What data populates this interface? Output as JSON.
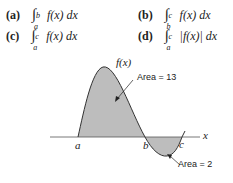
{
  "problems": [
    {
      "label": "(a)",
      "lower": "a",
      "upper": "b",
      "integrand": "f(x) dx"
    },
    {
      "label": "(b)",
      "lower": "b",
      "upper": "c",
      "integrand": "f(x) dx"
    },
    {
      "label": "(c)",
      "lower": "a",
      "upper": "c",
      "integrand": "f(x) dx"
    },
    {
      "label": "(d)",
      "lower": "a",
      "upper": "c",
      "integrand": "|f(x)| dx"
    }
  ],
  "graph": {
    "curve_label": "f(x)",
    "axis_label": "x",
    "points": {
      "a": "a",
      "b": "b",
      "c": "c"
    },
    "annotations": {
      "area_positive": "Area = 13",
      "area_negative": "Area = 2"
    },
    "fill_color": "#bdbdbd",
    "line_color": "#333333"
  }
}
